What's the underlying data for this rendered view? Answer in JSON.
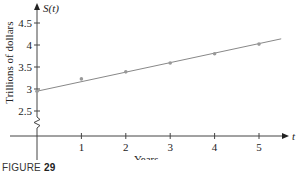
{
  "chart_data": {
    "type": "line",
    "title": "",
    "xlabel": "Years",
    "ylabel": "Trillions of dollars",
    "x_axis_var": "t",
    "y_axis_var": "S(t)",
    "x": [
      0,
      1,
      2,
      3,
      4,
      5
    ],
    "series": [
      {
        "name": "S(t)",
        "values": [
          2.95,
          3.23,
          3.39,
          3.59,
          3.8,
          4.02
        ],
        "markers": true
      }
    ],
    "trend_line": {
      "x_start": 0,
      "y_start": 2.95,
      "x_end": 5.5,
      "y_end": 4.14
    },
    "x_ticks": [
      "1",
      "2",
      "3",
      "4",
      "5"
    ],
    "y_ticks": [
      "2.5",
      "3",
      "3.5",
      "4",
      "4.5"
    ],
    "xlim": [
      0,
      5.6
    ],
    "ylim": [
      2.5,
      4.7
    ],
    "y_axis_break": true,
    "grid": false,
    "legend": null
  },
  "caption": {
    "prefix": "FIGURE",
    "number": "29"
  },
  "colors": {
    "axis": "#444444",
    "line": "#888888",
    "marker": "#999999",
    "text": "#222222"
  }
}
